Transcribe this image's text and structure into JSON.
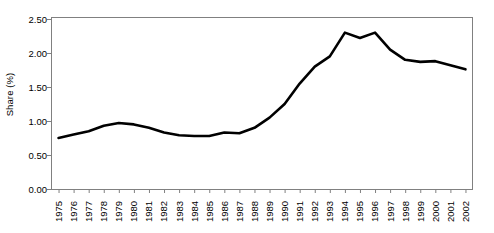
{
  "chart_data": {
    "type": "line",
    "title": "",
    "xlabel": "",
    "ylabel": "Share (%)",
    "ylim": [
      0.0,
      2.5
    ],
    "ytick_labels": [
      "0.00",
      "0.50",
      "1.00",
      "1.50",
      "2.00",
      "2.50"
    ],
    "ytick_values": [
      0.0,
      0.5,
      1.0,
      1.5,
      2.0,
      2.5
    ],
    "grid": false,
    "legend": "none",
    "line_color": "#000000",
    "axis_color": "#808080",
    "categories": [
      "1975",
      "1976",
      "1977",
      "1978",
      "1979",
      "1980",
      "1981",
      "1982",
      "1983",
      "1984",
      "1985",
      "1986",
      "1987",
      "1988",
      "1989",
      "1990",
      "1991",
      "1992",
      "1993",
      "1994",
      "1995",
      "1996",
      "1997",
      "1998",
      "1999",
      "2000",
      "2001",
      "2002"
    ],
    "x": [
      1975,
      1976,
      1977,
      1978,
      1979,
      1980,
      1981,
      1982,
      1983,
      1984,
      1985,
      1986,
      1987,
      1988,
      1989,
      1990,
      1991,
      1992,
      1993,
      1994,
      1995,
      1996,
      1997,
      1998,
      1999,
      2000,
      2001,
      2002
    ],
    "values": [
      0.75,
      0.8,
      0.85,
      0.93,
      0.97,
      0.95,
      0.9,
      0.83,
      0.79,
      0.78,
      0.78,
      0.83,
      0.82,
      0.9,
      1.05,
      1.25,
      1.55,
      1.8,
      1.95,
      2.3,
      2.22,
      2.3,
      2.05,
      1.9,
      1.87,
      1.88,
      1.82,
      1.76
    ],
    "series": [
      {
        "name": "Share (%)",
        "values": [
          0.75,
          0.8,
          0.85,
          0.93,
          0.97,
          0.95,
          0.9,
          0.83,
          0.79,
          0.78,
          0.78,
          0.83,
          0.82,
          0.9,
          1.05,
          1.25,
          1.55,
          1.8,
          1.95,
          2.3,
          2.22,
          2.3,
          2.05,
          1.9,
          1.87,
          1.88,
          1.82,
          1.76
        ]
      }
    ]
  }
}
